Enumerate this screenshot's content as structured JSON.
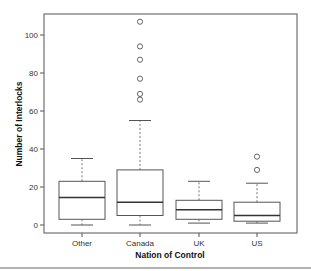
{
  "chart_data": {
    "type": "boxplot",
    "title": "",
    "xlabel": "Nation of Control",
    "ylabel": "Number of Interlocks",
    "ylim": [
      -3,
      113
    ],
    "yticks": [
      0,
      20,
      40,
      60,
      80,
      100
    ],
    "grid": false,
    "legend": null,
    "categories": [
      "Other",
      "Canada",
      "UK",
      "US"
    ],
    "boxes": [
      {
        "name": "Other",
        "min": 0,
        "q1": 3,
        "median": 14.5,
        "q3": 23,
        "max": 35,
        "outliers": []
      },
      {
        "name": "Canada",
        "min": 0,
        "q1": 5,
        "median": 12,
        "q3": 29,
        "max": 55,
        "outliers": [
          66,
          69,
          77,
          87,
          94,
          107
        ]
      },
      {
        "name": "UK",
        "min": 1,
        "q1": 3,
        "median": 8,
        "q3": 13,
        "max": 23,
        "outliers": []
      },
      {
        "name": "US",
        "min": 1,
        "q1": 2,
        "median": 5,
        "q3": 12,
        "max": 22,
        "outliers": [
          29,
          36
        ]
      }
    ]
  },
  "labels": {
    "xlabel": "Nation of Control",
    "ylabel": "Number of Interlocks",
    "yticks": [
      "0",
      "20",
      "40",
      "60",
      "80",
      "100"
    ],
    "xticks": [
      "Other",
      "Canada",
      "UK",
      "US"
    ]
  }
}
